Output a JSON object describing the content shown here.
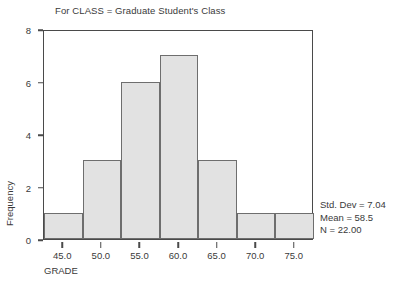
{
  "chart_data": {
    "type": "bar",
    "title": "For CLASS = Graduate Student's Class",
    "xlabel": "GRADE",
    "ylabel": "Frequency",
    "categories": [
      "42.5-47.5",
      "47.5-52.5",
      "52.5-57.5",
      "57.5-62.5",
      "62.5-67.5",
      "67.5-72.5",
      "72.5-77.5"
    ],
    "bin_centers": [
      45.0,
      50.0,
      55.0,
      60.0,
      65.0,
      70.0,
      75.0
    ],
    "bin_edges": [
      42.5,
      47.5,
      52.5,
      57.5,
      62.5,
      67.5,
      72.5,
      77.5
    ],
    "values": [
      1,
      3,
      6,
      7,
      3,
      1,
      1
    ],
    "xlim": [
      42.5,
      77.5
    ],
    "ylim": [
      0,
      8
    ],
    "x_ticks": [
      "45.0",
      "50.0",
      "55.0",
      "60.0",
      "65.0",
      "70.0",
      "75.0"
    ],
    "x_tick_values": [
      45.0,
      50.0,
      55.0,
      60.0,
      65.0,
      70.0,
      75.0
    ],
    "y_ticks": [
      "0",
      "2",
      "4",
      "6",
      "8"
    ],
    "y_tick_values": [
      0,
      2,
      4,
      6,
      8
    ],
    "grid": false,
    "legend": "none",
    "bar_fill_color": "#e2e2e2",
    "bar_edge_color": "#6e6e6e",
    "axis_color": "#4a4a4a",
    "background_color": "#ffffff",
    "annotations": [
      "Std. Dev = 7.04",
      "Mean = 58.5",
      "N = 22.00"
    ]
  },
  "stats": {
    "std_dev": "Std. Dev = 7.04",
    "mean": "Mean = 58.5",
    "n": "N = 22.00"
  }
}
